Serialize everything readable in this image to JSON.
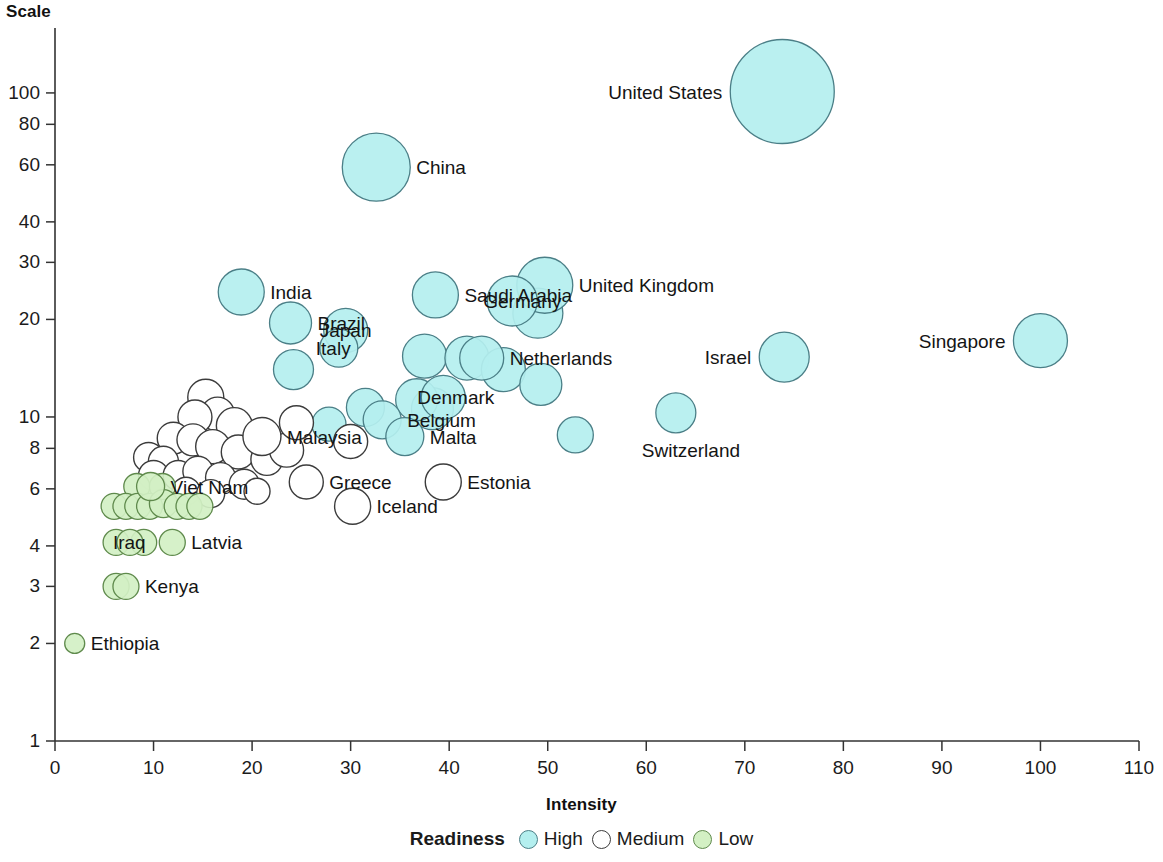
{
  "chart_data": {
    "type": "scatter",
    "title": "",
    "xlabel": "Intensity",
    "ylabel": "Scale",
    "xlim": [
      0,
      110
    ],
    "ylim": [
      1,
      130
    ],
    "yscale": "log",
    "grid": false,
    "xticks": [
      "0",
      "10",
      "20",
      "30",
      "40",
      "50",
      "60",
      "70",
      "80",
      "90",
      "100",
      "110"
    ],
    "xtick_values": [
      0,
      10,
      20,
      30,
      40,
      50,
      60,
      70,
      80,
      90,
      100,
      110
    ],
    "yticks": [
      "1",
      "2",
      "3",
      "4",
      "6",
      "8",
      "10",
      "20",
      "30",
      "40",
      "60",
      "80",
      "100"
    ],
    "ytick_values": [
      1,
      2,
      3,
      4,
      6,
      8,
      10,
      20,
      30,
      40,
      60,
      80,
      100
    ],
    "legend": {
      "title": "Readiness",
      "position": "bottom",
      "entries": [
        {
          "label": "High",
          "color": "#b4efef"
        },
        {
          "label": "Medium",
          "color": "#ffffff"
        },
        {
          "label": "Low",
          "color": "#d3f0c4"
        }
      ]
    },
    "size_meaning": "bubble size proportional to magnitude",
    "points": [
      {
        "name": "United States",
        "x": 73.8,
        "y": 101,
        "r": 52,
        "readiness": "High",
        "label_side": "left",
        "label_shown": true
      },
      {
        "name": "China",
        "x": 32.6,
        "y": 59,
        "r": 34,
        "readiness": "High",
        "label_side": "right",
        "label_shown": true
      },
      {
        "name": "United Kingdom",
        "x": 49.7,
        "y": 25.5,
        "r": 28,
        "readiness": "High",
        "label_side": "right",
        "label_shown": true
      },
      {
        "name": "Germany",
        "x": 46.4,
        "y": 22.8,
        "r": 25,
        "readiness": "High",
        "label_side": "center",
        "label_shown": true
      },
      {
        "name": "Japan",
        "x": 29.5,
        "y": 18.5,
        "r": 22,
        "readiness": "High",
        "label_side": "center",
        "label_shown": true
      },
      {
        "name": "India",
        "x": 18.9,
        "y": 24.3,
        "r": 23,
        "readiness": "High",
        "label_side": "right",
        "label_shown": true
      },
      {
        "name": "Saudi Arabia",
        "x": 38.6,
        "y": 23.8,
        "r": 23,
        "readiness": "High",
        "label_side": "right",
        "label_shown": true
      },
      {
        "name": "Italy",
        "x": 28.8,
        "y": 16.3,
        "r": 19,
        "readiness": "High",
        "label_side": "center",
        "label_shown": true
      },
      {
        "name": "Netherlands",
        "x": 43.3,
        "y": 15.2,
        "r": 22,
        "readiness": "High",
        "label_side": "right",
        "label_shown": true
      },
      {
        "name": "Denmark",
        "x": 39.4,
        "y": 11.5,
        "r": 22,
        "readiness": "High",
        "label_side": "center",
        "label_shown": true
      },
      {
        "name": "Belgium",
        "x": 33.2,
        "y": 9.8,
        "r": 19,
        "readiness": "High",
        "label_side": "right",
        "label_shown": true
      },
      {
        "name": "Malta",
        "x": 35.5,
        "y": 8.7,
        "r": 19,
        "readiness": "High",
        "label_side": "right",
        "label_shown": true
      },
      {
        "name": "Israel",
        "x": 74.0,
        "y": 15.3,
        "r": 25,
        "readiness": "High",
        "label_side": "left",
        "label_shown": true
      },
      {
        "name": "Singapore",
        "x": 100.0,
        "y": 17.2,
        "r": 27,
        "readiness": "High",
        "label_side": "left",
        "label_shown": true
      },
      {
        "name": "Switzerland",
        "x": 63.0,
        "y": 10.3,
        "r": 20,
        "readiness": "High",
        "label_side": "below",
        "label_shown": true
      },
      {
        "name": "Brazil",
        "x": 23.9,
        "y": 19.5,
        "r": 21,
        "readiness": "High",
        "label_side": "right",
        "label_shown": true
      },
      {
        "name": "Malaysia",
        "x": 21.0,
        "y": 8.7,
        "r": 19,
        "readiness": "Medium",
        "label_side": "right",
        "label_shown": true
      },
      {
        "name": "Greece",
        "x": 25.5,
        "y": 6.3,
        "r": 17,
        "readiness": "Medium",
        "label_side": "right",
        "label_shown": true
      },
      {
        "name": "Iceland",
        "x": 30.2,
        "y": 5.3,
        "r": 18,
        "readiness": "Medium",
        "label_side": "right",
        "label_shown": true
      },
      {
        "name": "Estonia",
        "x": 39.4,
        "y": 6.3,
        "r": 18,
        "readiness": "Medium",
        "label_side": "right",
        "label_shown": true
      },
      {
        "name": "Viet Nam",
        "x": 9.7,
        "y": 6.1,
        "r": 14,
        "readiness": "Low",
        "label_side": "right",
        "label_shown": true
      },
      {
        "name": "Latvia",
        "x": 11.9,
        "y": 4.1,
        "r": 13,
        "readiness": "Low",
        "label_side": "right",
        "label_shown": true
      },
      {
        "name": "Iraq",
        "x": 7.6,
        "y": 4.1,
        "r": 13,
        "readiness": "Low",
        "label_side": "center",
        "label_shown": true
      },
      {
        "name": "Kenya",
        "x": 7.2,
        "y": 3.0,
        "r": 13,
        "readiness": "Low",
        "label_side": "right",
        "label_shown": true
      },
      {
        "name": "Ethiopia",
        "x": 2.0,
        "y": 2.0,
        "r": 10,
        "readiness": "Low",
        "label_side": "right",
        "label_shown": true
      }
    ],
    "unlabeled_points": [
      {
        "x": 24.2,
        "y": 14.0,
        "r": 20,
        "readiness": "High"
      },
      {
        "x": 31.5,
        "y": 10.7,
        "r": 19,
        "readiness": "High"
      },
      {
        "x": 37.5,
        "y": 15.4,
        "r": 22,
        "readiness": "High"
      },
      {
        "x": 41.8,
        "y": 15.2,
        "r": 22,
        "readiness": "High"
      },
      {
        "x": 49.0,
        "y": 20.9,
        "r": 25,
        "readiness": "High"
      },
      {
        "x": 45.5,
        "y": 14.0,
        "r": 22,
        "readiness": "High"
      },
      {
        "x": 49.3,
        "y": 12.6,
        "r": 21,
        "readiness": "High"
      },
      {
        "x": 52.8,
        "y": 8.8,
        "r": 18,
        "readiness": "High"
      },
      {
        "x": 38.3,
        "y": 10.6,
        "r": 21,
        "readiness": "High"
      },
      {
        "x": 36.7,
        "y": 11.3,
        "r": 21,
        "readiness": "High"
      },
      {
        "x": 27.8,
        "y": 9.5,
        "r": 17,
        "readiness": "High"
      },
      {
        "x": 30.0,
        "y": 8.4,
        "r": 17,
        "readiness": "Medium"
      },
      {
        "x": 15.3,
        "y": 11.5,
        "r": 18,
        "readiness": "Medium"
      },
      {
        "x": 16.5,
        "y": 10.2,
        "r": 17,
        "readiness": "Medium"
      },
      {
        "x": 14.2,
        "y": 10.0,
        "r": 17,
        "readiness": "Medium"
      },
      {
        "x": 18.2,
        "y": 9.4,
        "r": 18,
        "readiness": "Medium"
      },
      {
        "x": 12.0,
        "y": 8.6,
        "r": 16,
        "readiness": "Medium"
      },
      {
        "x": 14.0,
        "y": 8.5,
        "r": 16,
        "readiness": "Medium"
      },
      {
        "x": 16.0,
        "y": 8.1,
        "r": 17,
        "readiness": "Medium"
      },
      {
        "x": 18.6,
        "y": 7.8,
        "r": 17,
        "readiness": "Medium"
      },
      {
        "x": 21.5,
        "y": 7.4,
        "r": 16,
        "readiness": "Medium"
      },
      {
        "x": 23.5,
        "y": 7.9,
        "r": 17,
        "readiness": "Medium"
      },
      {
        "x": 24.5,
        "y": 9.6,
        "r": 17,
        "readiness": "Medium"
      },
      {
        "x": 9.5,
        "y": 7.5,
        "r": 15,
        "readiness": "Medium"
      },
      {
        "x": 11.0,
        "y": 7.3,
        "r": 15,
        "readiness": "Medium"
      },
      {
        "x": 10.0,
        "y": 6.6,
        "r": 15,
        "readiness": "Medium"
      },
      {
        "x": 12.5,
        "y": 6.6,
        "r": 15,
        "readiness": "Medium"
      },
      {
        "x": 14.5,
        "y": 6.8,
        "r": 15,
        "readiness": "Medium"
      },
      {
        "x": 16.8,
        "y": 6.5,
        "r": 15,
        "readiness": "Medium"
      },
      {
        "x": 19.2,
        "y": 6.2,
        "r": 15,
        "readiness": "Medium"
      },
      {
        "x": 13.3,
        "y": 5.9,
        "r": 14,
        "readiness": "Medium"
      },
      {
        "x": 15.8,
        "y": 5.8,
        "r": 14,
        "readiness": "Medium"
      },
      {
        "x": 20.5,
        "y": 5.9,
        "r": 13,
        "readiness": "Medium"
      },
      {
        "x": 8.3,
        "y": 6.1,
        "r": 13,
        "readiness": "Low"
      },
      {
        "x": 10.9,
        "y": 6.1,
        "r": 13,
        "readiness": "Low"
      },
      {
        "x": 6.0,
        "y": 5.3,
        "r": 13,
        "readiness": "Low"
      },
      {
        "x": 7.2,
        "y": 5.3,
        "r": 13,
        "readiness": "Low"
      },
      {
        "x": 8.4,
        "y": 5.3,
        "r": 13,
        "readiness": "Low"
      },
      {
        "x": 9.6,
        "y": 5.3,
        "r": 13,
        "readiness": "Low"
      },
      {
        "x": 11.0,
        "y": 5.4,
        "r": 14,
        "readiness": "Low"
      },
      {
        "x": 12.4,
        "y": 5.3,
        "r": 13,
        "readiness": "Low"
      },
      {
        "x": 13.6,
        "y": 5.3,
        "r": 13,
        "readiness": "Low"
      },
      {
        "x": 14.7,
        "y": 5.3,
        "r": 13,
        "readiness": "Low"
      },
      {
        "x": 6.2,
        "y": 4.1,
        "r": 13,
        "readiness": "Low"
      },
      {
        "x": 9.0,
        "y": 4.1,
        "r": 13,
        "readiness": "Low"
      },
      {
        "x": 6.2,
        "y": 3.0,
        "r": 13,
        "readiness": "Low"
      }
    ]
  },
  "colors": {
    "high": "#b4efef",
    "medium": "#ffffff",
    "low": "#d3f0c4",
    "high_stroke": "#4b7f87",
    "medium_stroke": "#3c3c3c",
    "low_stroke": "#5f8a4c",
    "axis": "#333333",
    "text": "#141414"
  }
}
